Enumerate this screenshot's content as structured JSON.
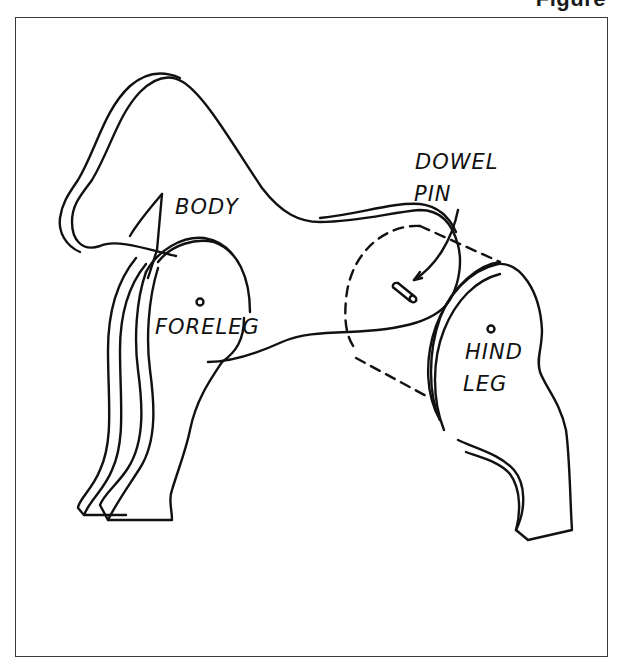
{
  "figure": {
    "heading": "Figure"
  },
  "diagram": {
    "labels": {
      "body": "BODY",
      "dowel_pin_line1": "DOWEL",
      "dowel_pin_line2": "PIN",
      "foreleg": "FORELEG",
      "hind_leg_line1": "HIND",
      "hind_leg_line2": "LEG"
    },
    "colors": {
      "ink": "#111111",
      "frame": "#3a3a3a",
      "background": "#ffffff"
    }
  }
}
